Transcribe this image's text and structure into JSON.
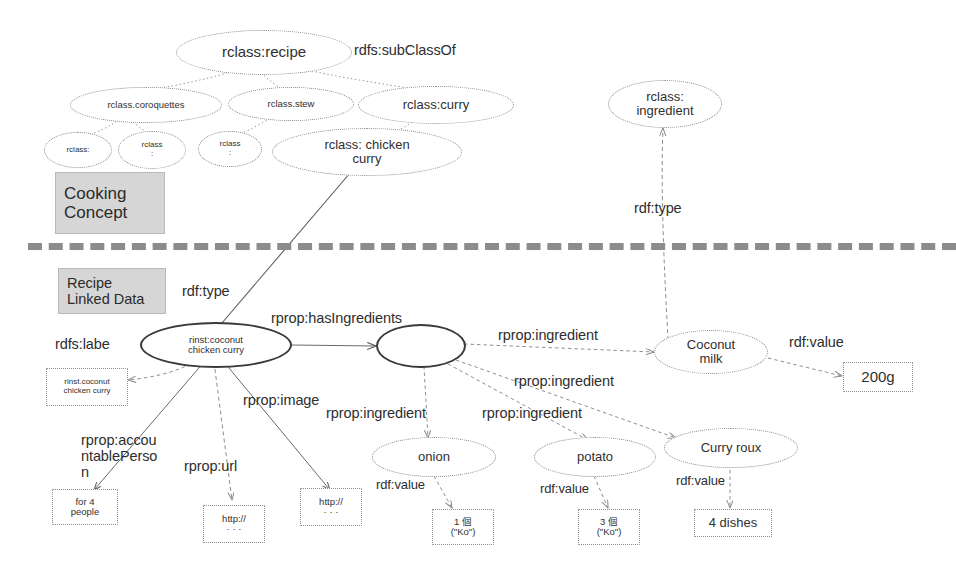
{
  "diagram": {
    "background": "#ffffff",
    "sections": [
      {
        "id": "cooking-concept",
        "label": "Cooking\nConcept"
      },
      {
        "id": "recipe-linked-data",
        "label": "Recipe\nLinked Data"
      }
    ],
    "ontology_nodes": [
      {
        "id": "rclass-recipe",
        "label": "rclass:recipe"
      },
      {
        "id": "rclass-coroquettes",
        "label": "rclass.coroquettes"
      },
      {
        "id": "rclass-stew",
        "label": "rclass.stew"
      },
      {
        "id": "rclass-curry",
        "label": "rclass:curry"
      },
      {
        "id": "rclass-sub-1",
        "label": "rclass:"
      },
      {
        "id": "rclass-sub-2",
        "label": "rclass\n:"
      },
      {
        "id": "rclass-sub-3",
        "label": "rclass\n:"
      },
      {
        "id": "rclass-chicken-curry",
        "label": "rclass: chicken\ncurry"
      },
      {
        "id": "rclass-ingredient",
        "label": "rclass:\ningredient"
      }
    ],
    "instance_nodes": [
      {
        "id": "rinst-coconut-chicken-curry",
        "label": "rinst:coconut\nchicken curry"
      },
      {
        "id": "blank-node",
        "label": ""
      },
      {
        "id": "coconut-milk",
        "label": "Coconut\nmilk"
      },
      {
        "id": "onion",
        "label": "onion"
      },
      {
        "id": "potato",
        "label": "potato"
      },
      {
        "id": "curry-roux",
        "label": "Curry roux"
      }
    ],
    "literal_boxes": [
      {
        "id": "lit-label",
        "label": "rinst.coconut\nchicken curry"
      },
      {
        "id": "lit-people",
        "label": "for 4\npeople"
      },
      {
        "id": "lit-url-1",
        "label": "http://\n· · ·"
      },
      {
        "id": "lit-url-2",
        "label": "http://\n· · ·"
      },
      {
        "id": "lit-onion-value",
        "label": "1 個\n(\"Ko\")"
      },
      {
        "id": "lit-potato-value",
        "label": "3 個\n(\"Ko\")"
      },
      {
        "id": "lit-roux-value",
        "label": "4 dishes"
      },
      {
        "id": "lit-milk-value",
        "label": "200g"
      }
    ],
    "edge_labels": [
      {
        "id": "edge-subclassof",
        "label": "rdfs:subClassOf"
      },
      {
        "id": "edge-rdftype-ingredient",
        "label": "rdf:type"
      },
      {
        "id": "edge-rdftype-recipe",
        "label": "rdf:type"
      },
      {
        "id": "edge-rdfslabel",
        "label": "rdfs:labe"
      },
      {
        "id": "edge-hasingredients",
        "label": "rprop:hasIngredients"
      },
      {
        "id": "edge-ingredient-1",
        "label": "rprop:ingredient"
      },
      {
        "id": "edge-ingredient-2",
        "label": "rprop:ingredient"
      },
      {
        "id": "edge-ingredient-3",
        "label": "rprop:ingredient"
      },
      {
        "id": "edge-ingredient-4",
        "label": "rprop:ingredient"
      },
      {
        "id": "edge-accountableperson",
        "label": "rprop:accou\nntablePerso\nn"
      },
      {
        "id": "edge-image",
        "label": "rprop:image"
      },
      {
        "id": "edge-url",
        "label": "rprop:url"
      },
      {
        "id": "edge-rdfvalue-onion",
        "label": "rdf:value"
      },
      {
        "id": "edge-rdfvalue-potato",
        "label": "rdf:value"
      },
      {
        "id": "edge-rdfvalue-roux",
        "label": "rdf:value"
      },
      {
        "id": "edge-rdfvalue-milk",
        "label": "rdf:value"
      }
    ],
    "colors": {
      "node_stroke": "#8a8a8a",
      "strong_stroke": "#3a3a3a",
      "text": "#2e2e2e",
      "section_fill": "#d6d6d6",
      "divider": "#8c8c8c"
    }
  }
}
